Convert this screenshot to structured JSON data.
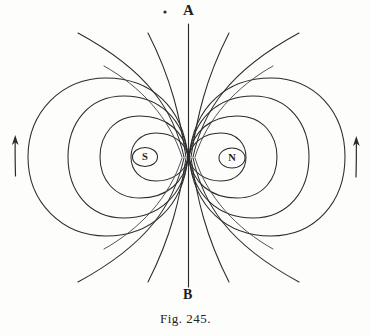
{
  "figure": {
    "caption": "Fig. 245.",
    "axis": {
      "top_label": "A",
      "bottom_label": "B"
    },
    "poles": [
      {
        "id": "south",
        "label": "S",
        "cx": 145,
        "cy": 157
      },
      {
        "id": "north",
        "label": "N",
        "cx": 232,
        "cy": 158
      }
    ],
    "arrows": [
      {
        "id": "left-arrow",
        "direction": "up"
      },
      {
        "id": "right-arrow",
        "direction": "up"
      }
    ],
    "colors": {
      "ink": "#2b2b2b",
      "paper": "#fdfdfc"
    }
  }
}
